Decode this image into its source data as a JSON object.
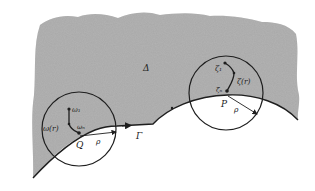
{
  "figure": {
    "type": "domain-boundary-diagram",
    "colors": {
      "background": "#ffffff",
      "region_fill": "#a9a9a9",
      "stroke": "#1e1e1e",
      "text": "#222222"
    },
    "region": {
      "label": "Δ"
    },
    "boundary": {
      "label": "Γ"
    },
    "left_disk": {
      "center_label": "Q",
      "radius_label": "ρ",
      "start_point_label": "ω₁",
      "end_point_label": "ωₙ",
      "path_label": "ω(r)"
    },
    "right_disk": {
      "center_label": "P",
      "radius_label": "ρ",
      "start_point_label": "ζ₁",
      "end_point_label": "ζₙ",
      "path_label": "ζ(r)"
    }
  }
}
